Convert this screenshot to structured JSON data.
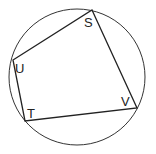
{
  "diagram": {
    "type": "cyclic-quadrilateral",
    "circle": {
      "cx": 77,
      "cy": 77,
      "r": 68,
      "stroke": "#333333"
    },
    "vertices": [
      {
        "name": "S",
        "x": 92,
        "y": 10
      },
      {
        "name": "V",
        "x": 137,
        "y": 108
      },
      {
        "name": "T",
        "x": 25,
        "y": 121
      },
      {
        "name": "U",
        "x": 13,
        "y": 60
      }
    ],
    "labels": {
      "S": "S",
      "U": "U",
      "T": "T",
      "V": "V"
    }
  }
}
